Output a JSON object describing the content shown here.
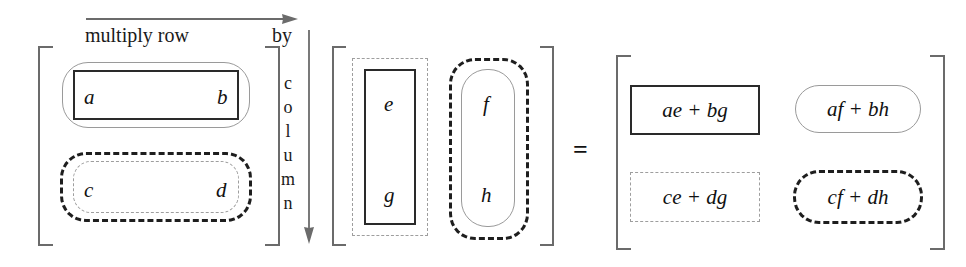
{
  "figure": {
    "equals_symbol": "="
  },
  "annotations": {
    "row_label": "multiply row",
    "by_label": "by",
    "column_label_letters": [
      "c",
      "o",
      "l",
      "u",
      "m",
      "n"
    ],
    "row_arrow_icon": "arrow-right-icon",
    "column_arrow_icon": "arrow-down-icon"
  },
  "matrix_a": {
    "name": "A",
    "rows": [
      {
        "id": "row1",
        "cells": [
          "a",
          "b"
        ],
        "style": "solid"
      },
      {
        "id": "row2",
        "cells": [
          "c",
          "d"
        ],
        "style": "dashed"
      }
    ]
  },
  "matrix_b": {
    "name": "B",
    "columns": [
      {
        "id": "col1",
        "cells": [
          "e",
          "g"
        ],
        "style": "solid-in-dashed"
      },
      {
        "id": "col2",
        "cells": [
          "f",
          "h"
        ],
        "style": "rounded-in-dashed"
      }
    ]
  },
  "matrix_product": {
    "name": "AB",
    "cells": [
      {
        "id": "p11",
        "text": "ae + bg",
        "style": "solid-dark-sharp"
      },
      {
        "id": "p12",
        "text": "af + bh",
        "style": "solid-light-round"
      },
      {
        "id": "p21",
        "text": "ce + dg",
        "style": "dashed-light-sharp"
      },
      {
        "id": "p22",
        "text": "cf + dh",
        "style": "dashed-dark-round"
      }
    ]
  },
  "colors": {
    "bracket": "#6b6b6b",
    "dark_stroke": "#2a2a2a",
    "light_stroke": "#9a9a9a",
    "text": "#111111",
    "background": "#ffffff"
  }
}
